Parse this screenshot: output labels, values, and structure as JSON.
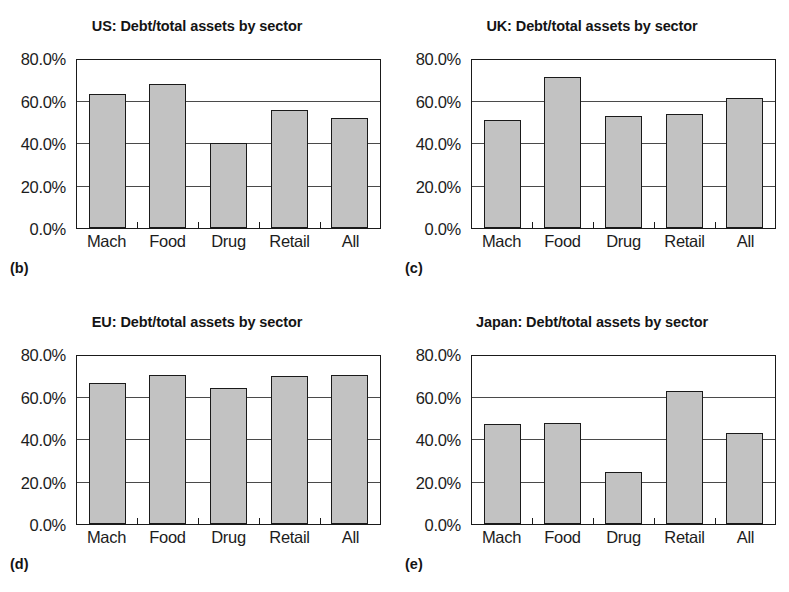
{
  "figure": {
    "background": "#ffffff",
    "bar_fill": "#c2c2c2",
    "bar_stroke": "#1a1a1a",
    "grid_color": "#4a4a4a"
  },
  "panels": [
    {
      "tag": "(b)",
      "title": "US: Debt/total assets by sector",
      "chart_data": {
        "type": "bar",
        "title": "US: Debt/total assets by sector",
        "xlabel": "",
        "ylabel": "",
        "categories": [
          "Mach",
          "Food",
          "Drug",
          "Retail",
          "All"
        ],
        "values": [
          63.0,
          68.0,
          40.0,
          55.5,
          52.0
        ],
        "ylim": [
          0,
          80
        ],
        "yticks": [
          0,
          20,
          40,
          60,
          80
        ],
        "ytick_labels": [
          "0.0%",
          "20.0%",
          "40.0%",
          "60.0%",
          "80.0%"
        ],
        "grid": true,
        "legend": "none"
      }
    },
    {
      "tag": "(c)",
      "title": "UK: Debt/total assets by sector",
      "chart_data": {
        "type": "bar",
        "title": "UK: Debt/total assets by sector",
        "xlabel": "",
        "ylabel": "",
        "categories": [
          "Mach",
          "Food",
          "Drug",
          "Retail",
          "All"
        ],
        "values": [
          51.0,
          71.0,
          52.5,
          53.5,
          61.0
        ],
        "ylim": [
          0,
          80
        ],
        "yticks": [
          0,
          20,
          40,
          60,
          80
        ],
        "ytick_labels": [
          "0.0%",
          "20.0%",
          "40.0%",
          "60.0%",
          "80.0%"
        ],
        "grid": true,
        "legend": "none"
      }
    },
    {
      "tag": "(d)",
      "title": "EU: Debt/total assets by sector",
      "chart_data": {
        "type": "bar",
        "title": "EU: Debt/total assets by sector",
        "xlabel": "",
        "ylabel": "",
        "categories": [
          "Mach",
          "Food",
          "Drug",
          "Retail",
          "All"
        ],
        "values": [
          66.5,
          70.0,
          64.0,
          69.5,
          70.0
        ],
        "ylim": [
          0,
          80
        ],
        "yticks": [
          0,
          20,
          40,
          60,
          80
        ],
        "ytick_labels": [
          "0.0%",
          "20.0%",
          "40.0%",
          "60.0%",
          "80.0%"
        ],
        "grid": true,
        "legend": "none"
      }
    },
    {
      "tag": "(e)",
      "title": "Japan: Debt/total assets by sector",
      "chart_data": {
        "type": "bar",
        "title": "Japan: Debt/total assets by sector",
        "xlabel": "",
        "ylabel": "",
        "categories": [
          "Mach",
          "Food",
          "Drug",
          "Retail",
          "All"
        ],
        "values": [
          47.0,
          47.5,
          24.5,
          62.5,
          43.0
        ],
        "ylim": [
          0,
          80
        ],
        "yticks": [
          0,
          20,
          40,
          60,
          80
        ],
        "ytick_labels": [
          "0.0%",
          "20.0%",
          "40.0%",
          "60.0%",
          "80.0%"
        ],
        "grid": true,
        "legend": "none"
      }
    }
  ]
}
